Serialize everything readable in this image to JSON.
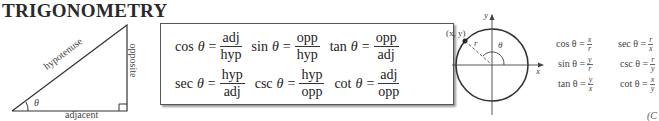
{
  "title": "TRIGONOMETRY",
  "triangle": {
    "hypotenuse": "hypotenuse",
    "opposite": "opposite",
    "adjacent": "adjacent",
    "angle": "θ"
  },
  "definitions": [
    [
      {
        "fn": "cos",
        "theta": "θ",
        "eq": "=",
        "num": "adj",
        "den": "hyp"
      },
      {
        "fn": "sin",
        "theta": "θ",
        "eq": "=",
        "num": "opp",
        "den": "hyp"
      },
      {
        "fn": "tan",
        "theta": "θ",
        "eq": "=",
        "num": "opp",
        "den": "adj"
      }
    ],
    [
      {
        "fn": "sec",
        "theta": "θ",
        "eq": "=",
        "num": "hyp",
        "den": "adj"
      },
      {
        "fn": "csc",
        "theta": "θ",
        "eq": "=",
        "num": "hyp",
        "den": "opp"
      },
      {
        "fn": "cot",
        "theta": "θ",
        "eq": "=",
        "num": "adj",
        "den": "opp"
      }
    ]
  ],
  "circle": {
    "point_label": "(x, y)",
    "r_label": "r",
    "angle": "θ",
    "x_axis": "x",
    "y_axis": "y"
  },
  "circle_definitions": [
    [
      {
        "text": "cos θ =",
        "num": "x",
        "den": "r"
      },
      {
        "text": "sec θ =",
        "num": "r",
        "den": "x"
      }
    ],
    [
      {
        "text": "sin θ =",
        "num": "y",
        "den": "r"
      },
      {
        "text": "csc θ =",
        "num": "r",
        "den": "y"
      }
    ],
    [
      {
        "text": "tan θ =",
        "num": "y",
        "den": "x"
      },
      {
        "text": "cot θ =",
        "num": "x",
        "den": "y"
      }
    ]
  ],
  "corner_text": "(C"
}
